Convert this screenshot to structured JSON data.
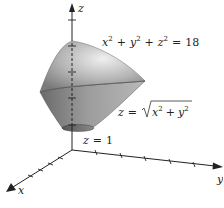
{
  "figure": {
    "axes": {
      "x_label": "x",
      "y_label": "y",
      "z_label": "z"
    },
    "equations": {
      "sphere": {
        "lhs_x": "x",
        "lhs_y": "y",
        "lhs_z": "z",
        "exp": "2",
        "plus": "+",
        "eq": "=",
        "rhs": "18"
      },
      "cone": {
        "lhs": "z",
        "eq": "=",
        "rad_x": "x",
        "rad_y": "y",
        "exp": "2",
        "plus": "+"
      },
      "plane": {
        "lhs": "z",
        "eq": "=",
        "rhs": "1"
      }
    },
    "colors": {
      "surface_light": "#e6e6e6",
      "surface_mid": "#a8a8a8",
      "surface_dark": "#6e6e6e",
      "axis": "#222222"
    }
  }
}
